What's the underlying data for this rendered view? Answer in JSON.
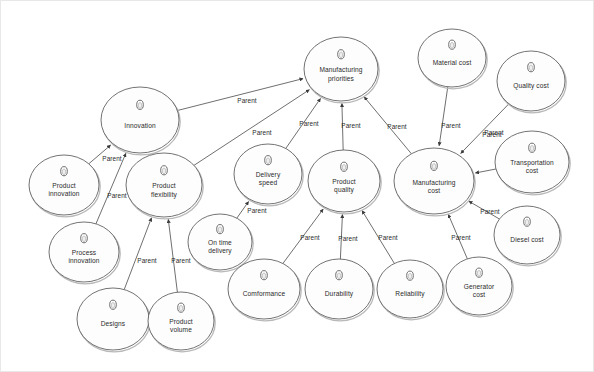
{
  "diagram": {
    "background_color": "#ffffff",
    "node_fill_color": "#fdfdfd",
    "node_stroke_color": "#5a5a5a",
    "edge_color": "#4a4a4a",
    "text_color": "#2b2b2b",
    "node_icon_name": "node-handle-oval-icon",
    "relation_label": "Parent"
  },
  "nodes": [
    {
      "id": "innovation",
      "label": "Innovation",
      "cx": 139,
      "cy": 119,
      "rx": 39,
      "ry": 33
    },
    {
      "id": "product-innovation",
      "label": "Product\ninnovation",
      "cx": 63,
      "cy": 184,
      "rx": 35,
      "ry": 30
    },
    {
      "id": "process-innovation",
      "label": "Process\ninnovation",
      "cx": 83,
      "cy": 251,
      "rx": 35,
      "ry": 30
    },
    {
      "id": "product-flexibility",
      "label": "Product\nflexibility",
      "cx": 163,
      "cy": 184,
      "rx": 38,
      "ry": 32
    },
    {
      "id": "designs",
      "label": "Designs",
      "cx": 112,
      "cy": 318,
      "rx": 36,
      "ry": 31
    },
    {
      "id": "product-volume",
      "label": "Product\nvolume",
      "cx": 180,
      "cy": 320,
      "rx": 33,
      "ry": 29
    },
    {
      "id": "on-time-delivery",
      "label": "On time\ndelivery",
      "cx": 219,
      "cy": 241,
      "rx": 32,
      "ry": 28
    },
    {
      "id": "delivery-speed",
      "label": "Delivery\nspeed",
      "cx": 267,
      "cy": 173,
      "rx": 34,
      "ry": 30
    },
    {
      "id": "manufacturing-priorities",
      "label": "Manufacturing\npriorities",
      "cx": 340,
      "cy": 68,
      "rx": 37,
      "ry": 32
    },
    {
      "id": "product-quality",
      "label": "Product\nquality",
      "cx": 343,
      "cy": 180,
      "rx": 36,
      "ry": 31
    },
    {
      "id": "comformance",
      "label": "Comformance",
      "cx": 263,
      "cy": 288,
      "rx": 36,
      "ry": 30
    },
    {
      "id": "durability",
      "label": "Durability",
      "cx": 338,
      "cy": 288,
      "rx": 34,
      "ry": 30
    },
    {
      "id": "reliability",
      "label": "Reliability",
      "cx": 409,
      "cy": 288,
      "rx": 33,
      "ry": 29
    },
    {
      "id": "manufacturing-cost",
      "label": "Manufacturing\ncost",
      "cx": 433,
      "cy": 180,
      "rx": 40,
      "ry": 33
    },
    {
      "id": "material-cost",
      "label": "Material cost",
      "cx": 451,
      "cy": 57,
      "rx": 34,
      "ry": 29
    },
    {
      "id": "quality-cost",
      "label": "Quality cost",
      "cx": 530,
      "cy": 80,
      "rx": 34,
      "ry": 30
    },
    {
      "id": "transportation-cost",
      "label": "Transportation\ncost",
      "cx": 531,
      "cy": 161,
      "rx": 37,
      "ry": 31
    },
    {
      "id": "diesel-cost",
      "label": "Diesel cost",
      "cx": 526,
      "cy": 234,
      "rx": 33,
      "ry": 29
    },
    {
      "id": "generator-cost",
      "label": "Generator\ncost",
      "cx": 478,
      "cy": 285,
      "rx": 33,
      "ry": 29
    }
  ],
  "edges": [
    {
      "from": "innovation",
      "to": "manufacturing-priorities",
      "label": "Parent",
      "lx": 246,
      "ly": 99
    },
    {
      "from": "product-innovation",
      "to": "innovation",
      "label": "Parent",
      "lx": 111,
      "ly": 157
    },
    {
      "from": "process-innovation",
      "to": "innovation",
      "label": "Parent",
      "lx": 116,
      "ly": 194
    },
    {
      "from": "product-flexibility",
      "to": "manufacturing-priorities",
      "label": "Parent",
      "lx": 261,
      "ly": 131
    },
    {
      "from": "designs",
      "to": "product-flexibility",
      "label": "Parent",
      "lx": 146,
      "ly": 259
    },
    {
      "from": "product-volume",
      "to": "product-flexibility",
      "label": "Parent",
      "lx": 180,
      "ly": 259
    },
    {
      "from": "on-time-delivery",
      "to": "delivery-speed",
      "label": "Parent",
      "lx": 256,
      "ly": 209
    },
    {
      "from": "delivery-speed",
      "to": "manufacturing-priorities",
      "label": "Parent",
      "lx": 308,
      "ly": 122
    },
    {
      "from": "product-quality",
      "to": "manufacturing-priorities",
      "label": "Parent",
      "lx": 350,
      "ly": 124
    },
    {
      "from": "comformance",
      "to": "product-quality",
      "label": "Parent",
      "lx": 309,
      "ly": 236
    },
    {
      "from": "durability",
      "to": "product-quality",
      "label": "Parent",
      "lx": 347,
      "ly": 237
    },
    {
      "from": "reliability",
      "to": "product-quality",
      "label": "Parent",
      "lx": 387,
      "ly": 236
    },
    {
      "from": "manufacturing-cost",
      "to": "manufacturing-priorities",
      "label": "Parent",
      "lx": 396,
      "ly": 125
    },
    {
      "from": "material-cost",
      "to": "manufacturing-cost",
      "label": "Parent",
      "lx": 450,
      "ly": 124
    },
    {
      "from": "quality-cost",
      "to": "manufacturing-cost",
      "label": "Parent",
      "lx": 491,
      "ly": 133
    },
    {
      "from": "transportation-cost",
      "to": "manufacturing-cost",
      "label": "Parent",
      "lx": 493,
      "ly": 131
    },
    {
      "from": "diesel-cost",
      "to": "manufacturing-cost",
      "label": "Parent",
      "lx": 489,
      "ly": 210
    },
    {
      "from": "generator-cost",
      "to": "manufacturing-cost",
      "label": "Parent",
      "lx": 460,
      "ly": 236
    }
  ]
}
